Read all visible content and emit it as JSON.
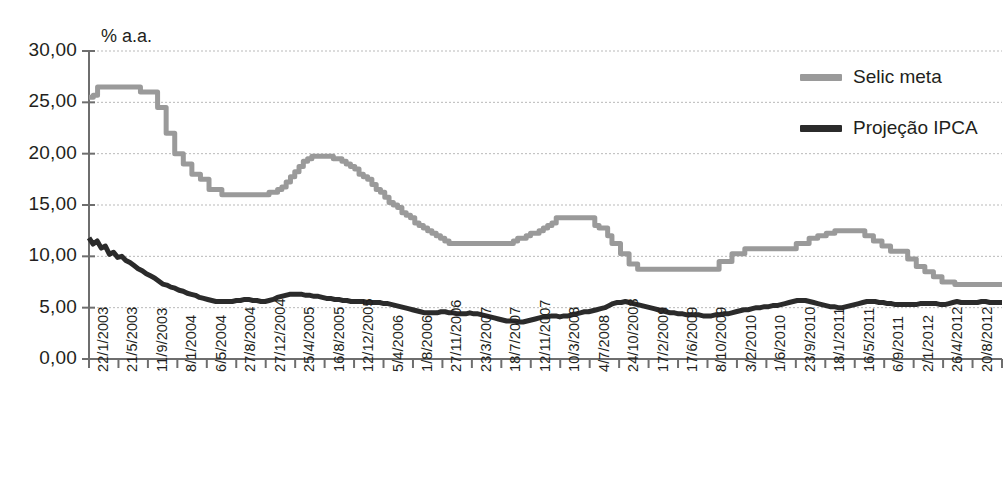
{
  "chart": {
    "unit_label": "% a.a.",
    "title_fragment": ""
  },
  "legend": {
    "position": "top-right",
    "items": [
      {
        "label": "Selic meta",
        "color": "#9a9a9a",
        "name": "legend-selic-meta"
      },
      {
        "label": "Projeção IPCA",
        "color": "#2b2b2b",
        "name": "legend-projecao-ipca"
      }
    ]
  },
  "chart_data": {
    "type": "line",
    "title": "",
    "subtitle": "",
    "xlabel": "",
    "ylabel": "% a.a.",
    "ylim": [
      0,
      30
    ],
    "ytick_step": 5,
    "grid": true,
    "legend_position": "top-right",
    "ytick_labels": [
      "0,00",
      "5,00",
      "10,00",
      "15,00",
      "20,00",
      "25,00",
      "30,00"
    ],
    "ytick_values": [
      0,
      5,
      10,
      15,
      20,
      25,
      30
    ],
    "xtick_labels": [
      "22/1/2003",
      "21/5/2003",
      "11/9/2003",
      "8/1/2004",
      "6/5/2004",
      "27/8/2004",
      "27/12/2004",
      "25/4/2005",
      "16/8/2005",
      "12/12/2005",
      "5/4/2006",
      "1/8/2006",
      "27/11/2006",
      "23/3/2007",
      "18/7/2007",
      "12/11/2007",
      "10/3/2008",
      "4/7/2008",
      "24/10/2008",
      "17/2/2009",
      "17/6/2009",
      "8/10/2009",
      "3/2/2010",
      "1/6/2010",
      "23/9/2010",
      "18/1/2011",
      "16/5/2011",
      "6/9/2011",
      "2/1/2012",
      "26/4/2012",
      "20/8/2012",
      "14/12/2012"
    ],
    "series": [
      {
        "name": "Selic meta",
        "color": "#9a9a9a",
        "style": "step",
        "values": [
          25.5,
          25.7,
          26.5,
          26.5,
          26.5,
          26.5,
          26.5,
          26.5,
          26.5,
          26.5,
          26.5,
          26.5,
          26.0,
          26.0,
          26.0,
          26.0,
          24.5,
          24.5,
          22.0,
          22.0,
          20.0,
          20.0,
          19.0,
          19.0,
          18.0,
          18.0,
          17.5,
          17.5,
          16.5,
          16.5,
          16.5,
          16.0,
          16.0,
          16.0,
          16.0,
          16.0,
          16.0,
          16.0,
          16.0,
          16.0,
          16.0,
          16.0,
          16.25,
          16.25,
          16.5,
          16.75,
          17.25,
          17.75,
          18.25,
          18.75,
          19.25,
          19.5,
          19.75,
          19.75,
          19.75,
          19.75,
          19.75,
          19.5,
          19.5,
          19.25,
          19.0,
          18.75,
          18.5,
          18.0,
          17.75,
          17.5,
          17.0,
          16.5,
          16.25,
          15.75,
          15.25,
          15.0,
          14.75,
          14.25,
          14.0,
          13.75,
          13.25,
          13.0,
          12.75,
          12.5,
          12.25,
          12.0,
          11.75,
          11.5,
          11.25,
          11.25,
          11.25,
          11.25,
          11.25,
          11.25,
          11.25,
          11.25,
          11.25,
          11.25,
          11.25,
          11.25,
          11.25,
          11.25,
          11.25,
          11.5,
          11.75,
          11.75,
          12.0,
          12.25,
          12.25,
          12.5,
          12.75,
          13.0,
          13.25,
          13.75,
          13.75,
          13.75,
          13.75,
          13.75,
          13.75,
          13.75,
          13.75,
          13.75,
          13.0,
          12.75,
          12.75,
          12.0,
          11.25,
          11.25,
          10.25,
          10.25,
          9.25,
          9.25,
          8.75,
          8.75,
          8.75,
          8.75,
          8.75,
          8.75,
          8.75,
          8.75,
          8.75,
          8.75,
          8.75,
          8.75,
          8.75,
          8.75,
          8.75,
          8.75,
          8.75,
          8.75,
          8.75,
          9.5,
          9.5,
          9.5,
          10.25,
          10.25,
          10.25,
          10.75,
          10.75,
          10.75,
          10.75,
          10.75,
          10.75,
          10.75,
          10.75,
          10.75,
          10.75,
          10.75,
          10.75,
          11.25,
          11.25,
          11.25,
          11.75,
          11.75,
          12.0,
          12.0,
          12.25,
          12.25,
          12.5,
          12.5,
          12.5,
          12.5,
          12.5,
          12.5,
          12.5,
          12.0,
          12.0,
          11.5,
          11.5,
          11.0,
          11.0,
          10.5,
          10.5,
          10.5,
          10.5,
          9.75,
          9.75,
          9.0,
          9.0,
          8.5,
          8.5,
          8.0,
          8.0,
          7.5,
          7.5,
          7.5,
          7.25,
          7.25,
          7.25,
          7.25,
          7.25,
          7.25,
          7.25,
          7.25,
          7.25,
          7.25,
          7.25,
          7.25
        ]
      },
      {
        "name": "Projeção IPCA",
        "color": "#2b2b2b",
        "style": "line",
        "values": [
          11.8,
          11.2,
          11.5,
          10.8,
          11.0,
          10.2,
          10.4,
          9.9,
          10.0,
          9.6,
          9.4,
          9.1,
          8.8,
          8.6,
          8.3,
          8.1,
          7.9,
          7.6,
          7.3,
          7.2,
          7.0,
          6.9,
          6.7,
          6.6,
          6.4,
          6.3,
          6.2,
          6.0,
          5.9,
          5.8,
          5.7,
          5.6,
          5.6,
          5.6,
          5.6,
          5.6,
          5.7,
          5.7,
          5.8,
          5.8,
          5.7,
          5.7,
          5.6,
          5.6,
          5.7,
          5.8,
          6.0,
          6.1,
          6.2,
          6.3,
          6.3,
          6.3,
          6.3,
          6.2,
          6.2,
          6.1,
          6.1,
          6.0,
          5.9,
          5.9,
          5.8,
          5.8,
          5.7,
          5.7,
          5.6,
          5.6,
          5.6,
          5.6,
          5.5,
          5.5,
          5.5,
          5.5,
          5.4,
          5.4,
          5.3,
          5.2,
          5.1,
          5.0,
          4.9,
          4.8,
          4.7,
          4.6,
          4.5,
          4.5,
          4.5,
          4.5,
          4.6,
          4.6,
          4.5,
          4.5,
          4.4,
          4.4,
          4.4,
          4.5,
          4.4,
          4.4,
          4.3,
          4.2,
          4.1,
          4.0,
          3.9,
          3.8,
          3.7,
          3.7,
          3.7,
          3.6,
          3.6,
          3.7,
          3.8,
          3.9,
          4.0,
          4.1,
          4.1,
          4.2,
          4.2,
          4.1,
          4.2,
          4.2,
          4.3,
          4.4,
          4.5,
          4.6,
          4.6,
          4.7,
          4.8,
          4.9,
          5.0,
          5.2,
          5.4,
          5.5,
          5.5,
          5.6,
          5.5,
          5.4,
          5.3,
          5.2,
          5.1,
          5.0,
          4.9,
          4.8,
          4.7,
          4.6,
          4.5,
          4.5,
          4.4,
          4.4,
          4.3,
          4.3,
          4.3,
          4.3,
          4.2,
          4.2,
          4.2,
          4.3,
          4.3,
          4.4,
          4.4,
          4.5,
          4.6,
          4.7,
          4.8,
          4.8,
          4.9,
          5.0,
          5.0,
          5.1,
          5.1,
          5.2,
          5.2,
          5.3,
          5.4,
          5.5,
          5.6,
          5.7,
          5.7,
          5.7,
          5.6,
          5.5,
          5.4,
          5.3,
          5.2,
          5.1,
          5.1,
          5.0,
          5.0,
          5.1,
          5.2,
          5.3,
          5.4,
          5.5,
          5.6,
          5.6,
          5.6,
          5.5,
          5.5,
          5.4,
          5.4,
          5.3,
          5.3,
          5.3,
          5.3,
          5.3,
          5.3,
          5.4,
          5.4,
          5.4,
          5.4,
          5.4,
          5.3,
          5.3,
          5.4,
          5.5,
          5.6,
          5.5,
          5.5,
          5.5,
          5.5,
          5.5,
          5.6,
          5.6,
          5.5,
          5.5,
          5.5,
          5.5
        ]
      }
    ]
  }
}
